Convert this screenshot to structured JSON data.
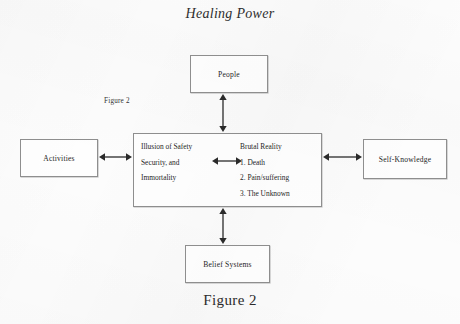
{
  "title": "Healing Power",
  "caption": "Figure 2",
  "inline_label": "Figure 2",
  "nodes": {
    "people": "People",
    "activities": "Activities",
    "self_knowledge": "Self-Knowledge",
    "belief_systems": "Belief Systems"
  },
  "center": {
    "left_column": {
      "line1": "Illusion of Safety",
      "line2": "Security, and",
      "line3": "Immortality"
    },
    "right_column": {
      "heading": "Brutal Reality",
      "item1": "1. Death",
      "item2": "2. Pain/suffering",
      "item3": "3. The Unknown"
    }
  },
  "arrows": {
    "people_center": "double-headed-vertical-arrow",
    "center_belief": "double-headed-vertical-arrow",
    "activities_center": "double-headed-horizontal-arrow",
    "center_self": "double-headed-horizontal-arrow",
    "center_inner": "double-headed-horizontal-arrow"
  },
  "colors": {
    "ink": "#262626",
    "box_border": "#8e8e8e",
    "paper": "#fcfcfc"
  }
}
